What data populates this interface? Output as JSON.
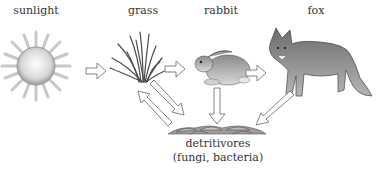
{
  "diagram": {
    "type": "food-chain",
    "nodes": [
      {
        "id": "sunlight",
        "label": "sunlight"
      },
      {
        "id": "grass",
        "label": "grass"
      },
      {
        "id": "rabbit",
        "label": "rabbit"
      },
      {
        "id": "fox",
        "label": "fox"
      },
      {
        "id": "detritivores",
        "label": "detritivores",
        "sublabel": "(fungi, bacteria)"
      }
    ],
    "edges": [
      {
        "from": "sunlight",
        "to": "grass"
      },
      {
        "from": "grass",
        "to": "rabbit"
      },
      {
        "from": "rabbit",
        "to": "fox"
      },
      {
        "from": "grass",
        "to": "detritivores"
      },
      {
        "from": "detritivores",
        "to": "grass"
      },
      {
        "from": "rabbit",
        "to": "detritivores"
      },
      {
        "from": "fox",
        "to": "detritivores"
      }
    ]
  }
}
